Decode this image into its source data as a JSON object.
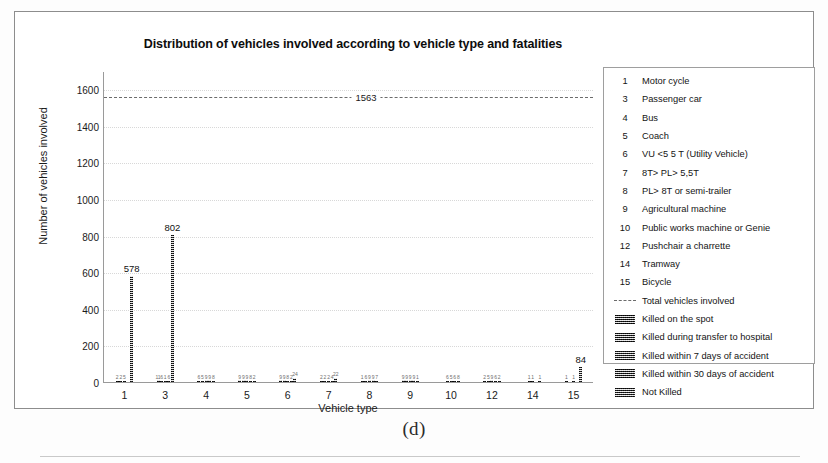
{
  "figure": {
    "caption": "(d)"
  },
  "chart_data": {
    "type": "bar",
    "title": "Distribution of vehicles involved according to vehicle type and fatalities",
    "xlabel": "Vehicle type",
    "ylabel": "Number of vehicles involved",
    "ylim": [
      0,
      1700
    ],
    "yticks": [
      0,
      200,
      400,
      600,
      800,
      1000,
      1200,
      1400,
      1600
    ],
    "grid": true,
    "legend_position": "right",
    "categories": [
      "1",
      "3",
      "4",
      "5",
      "6",
      "7",
      "8",
      "9",
      "10",
      "12",
      "14",
      "15"
    ],
    "reference_line": {
      "label": "1563",
      "value": 1563,
      "name": "Total vehicles involved",
      "style": "dashed"
    },
    "series": [
      {
        "name": "Killed on the spot",
        "values": [
          2,
          11,
          6,
          9,
          9,
          2,
          1,
          9,
          0,
          2,
          0,
          1
        ]
      },
      {
        "name": "Killed during transfer to hospital",
        "values": [
          2,
          6,
          5,
          9,
          9,
          2,
          6,
          9,
          6,
          5,
          1,
          0
        ]
      },
      {
        "name": "Killed within 7 days of accident",
        "values": [
          5,
          1,
          9,
          9,
          8,
          2,
          9,
          9,
          5,
          9,
          1,
          1
        ]
      },
      {
        "name": "Killed within 30 days of accident",
        "values": [
          0,
          6,
          9,
          8,
          2,
          4,
          9,
          9,
          6,
          6,
          0,
          0
        ]
      },
      {
        "name": "Not Killed",
        "values": [
          578,
          802,
          8,
          2,
          24,
          22,
          7,
          1,
          8,
          2,
          1,
          84
        ]
      }
    ],
    "labeled_values": [
      {
        "category": "1",
        "value": 578,
        "label": "578"
      },
      {
        "category": "3",
        "value": 802,
        "label": "802"
      },
      {
        "category": "15",
        "value": 84,
        "label": "84"
      }
    ]
  },
  "legend": {
    "vehicle_types": [
      {
        "key": "1",
        "label": "Motor cycle"
      },
      {
        "key": "3",
        "label": "Passenger car"
      },
      {
        "key": "4",
        "label": "Bus"
      },
      {
        "key": "5",
        "label": "Coach"
      },
      {
        "key": "6",
        "label": "VU <5 5 T (Utility Vehicle)"
      },
      {
        "key": "7",
        "label": "8T> PL> 5,5T"
      },
      {
        "key": "8",
        "label": "PL> 8T or semi-trailer"
      },
      {
        "key": "9",
        "label": "Agricultural machine"
      },
      {
        "key": "10",
        "label": "Public works machine or Genie"
      },
      {
        "key": "12",
        "label": "Pushchair a charrette"
      },
      {
        "key": "14",
        "label": "Tramway"
      },
      {
        "key": "15",
        "label": "Bicycle"
      }
    ],
    "total_entry": {
      "label": "Total vehicles involved"
    },
    "fatality_entries": [
      {
        "label": "Killed on the spot"
      },
      {
        "label": "Killed during transfer to hospital"
      },
      {
        "label": "Killed within 7 days of accident"
      },
      {
        "label": "Killed within 30 days of accident"
      },
      {
        "label": "Not Killed"
      }
    ]
  }
}
